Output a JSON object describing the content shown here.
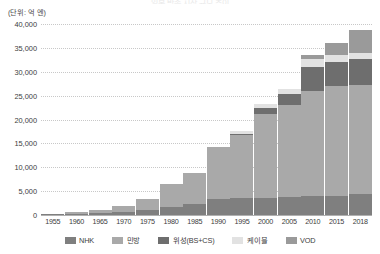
{
  "chart_data": {
    "type": "bar",
    "stacked": true,
    "title": "",
    "subtitle": "",
    "unit_label": "(단위: 억 엔)",
    "xlabel": "",
    "ylabel": "",
    "ylim": [
      0,
      40000
    ],
    "ytick_step": 5000,
    "yticks": [
      "0",
      "5,000",
      "10,000",
      "15,000",
      "20,000",
      "25,000",
      "30,000",
      "35,000",
      "40,000"
    ],
    "ytick_values": [
      0,
      5000,
      10000,
      15000,
      20000,
      25000,
      30000,
      35000,
      40000
    ],
    "grid": true,
    "legend_position": "bottom",
    "categories": [
      "1955",
      "1960",
      "1965",
      "1970",
      "1975",
      "1980",
      "1985",
      "1990",
      "1995",
      "2000",
      "2005",
      "2010",
      "2015",
      "2018"
    ],
    "series": [
      {
        "name": "NHK",
        "color": "#7f7f7f",
        "values": [
          120,
          240,
          450,
          620,
          950,
          1700,
          2350,
          3250,
          3550,
          3650,
          3750,
          3900,
          4050,
          4450
        ]
      },
      {
        "name": "민방",
        "color": "#a9a9a9",
        "values": [
          130,
          290,
          560,
          1180,
          2350,
          4700,
          6450,
          11050,
          13150,
          17450,
          19250,
          22000,
          22900,
          22850
        ]
      },
      {
        "name": "위성(BS+CS)",
        "color": "#6e6e6e",
        "values": [
          0,
          0,
          0,
          0,
          0,
          0,
          0,
          0,
          300,
          1400,
          2400,
          5000,
          5200,
          5300
        ]
      },
      {
        "name": "케이블",
        "color": "#e2e2e2",
        "values": [
          0,
          0,
          0,
          0,
          0,
          0,
          0,
          0,
          650,
          800,
          900,
          1800,
          1400,
          1350
        ]
      },
      {
        "name": "VOD",
        "color": "#9a9a9a",
        "values": [
          0,
          0,
          0,
          0,
          0,
          0,
          0,
          0,
          0,
          0,
          0,
          750,
          2450,
          4750
        ]
      }
    ],
    "totals": [
      250,
      530,
      1010,
      1800,
      3300,
      6400,
      8800,
      14300,
      17650,
      23300,
      26300,
      33450,
      36000,
      38700
    ]
  },
  "legend": {
    "items": [
      {
        "label": "NHK",
        "color": "#7f7f7f"
      },
      {
        "label": "민방",
        "color": "#a9a9a9"
      },
      {
        "label": "위성(BS+CS)",
        "color": "#6e6e6e"
      },
      {
        "label": "케이블",
        "color": "#e2e2e2"
      },
      {
        "label": "VOD",
        "color": "#9a9a9a"
      }
    ]
  },
  "header": {
    "title_sliver": "일본 방송 시장 규모 추이"
  }
}
